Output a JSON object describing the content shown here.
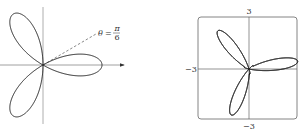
{
  "figures": [
    {
      "name": "three-leaved-rose",
      "curve": "r = cos(3θ)",
      "annotation": {
        "theta": "θ",
        "equals": "=",
        "numerator": "π",
        "denominator": "6"
      },
      "origin": [
        43,
        65
      ],
      "scale": 59,
      "petals": 3,
      "ray_angle_deg": 30
    },
    {
      "name": "flower-curve",
      "axis_labels": {
        "top": "3",
        "bottom": "−3",
        "left": "−3"
      },
      "origin": [
        249,
        69
      ],
      "scale": 16.5
    }
  ],
  "colors": {
    "curve": "#222222",
    "axis": "#999999",
    "frame": "#777777"
  }
}
